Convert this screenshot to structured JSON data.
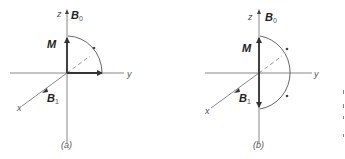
{
  "figure": {
    "panels": [
      {
        "id": "a",
        "caption": "(a)",
        "axes": {
          "z": "z",
          "y": "y",
          "x": "x"
        },
        "vectors": {
          "static_field": "B",
          "static_field_sub": "0",
          "magnetization": "M",
          "rf_field": "B",
          "rf_field_sub": "1"
        },
        "description": "Magnetization M rotates 90 degrees from z-axis into y-axis about B1 along x"
      },
      {
        "id": "b",
        "caption": "(b)",
        "axes": {
          "z": "z",
          "y": "y",
          "x": "x"
        },
        "vectors": {
          "static_field": "B",
          "static_field_sub": "0",
          "magnetization": "M",
          "rf_field": "B",
          "rf_field_sub": "1"
        },
        "description": "Magnetization M rotates 180 degrees from +z to -z about B1 along x"
      }
    ],
    "colors": {
      "line": "#6a6a6a",
      "vector": "#333333",
      "text": "#333333",
      "background": "#ffffff"
    }
  }
}
